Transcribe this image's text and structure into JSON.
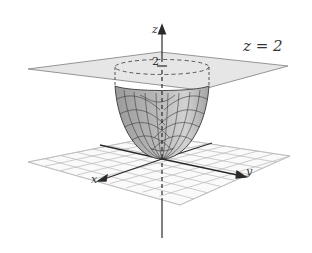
{
  "figure": {
    "plane_label": "z = 2",
    "tick_label": "2",
    "axes": {
      "x": "x",
      "y": "y",
      "z": "z"
    },
    "colors": {
      "plane_fill": "#e6e6e6",
      "plane_edge": "#8a8a8a",
      "surface_fill": "#a8a8a8",
      "surface_light": "#cfcfcf",
      "mesh": "#3a3a3a",
      "grid": "#b5b5b5",
      "axis": "#2a2a2a"
    }
  }
}
